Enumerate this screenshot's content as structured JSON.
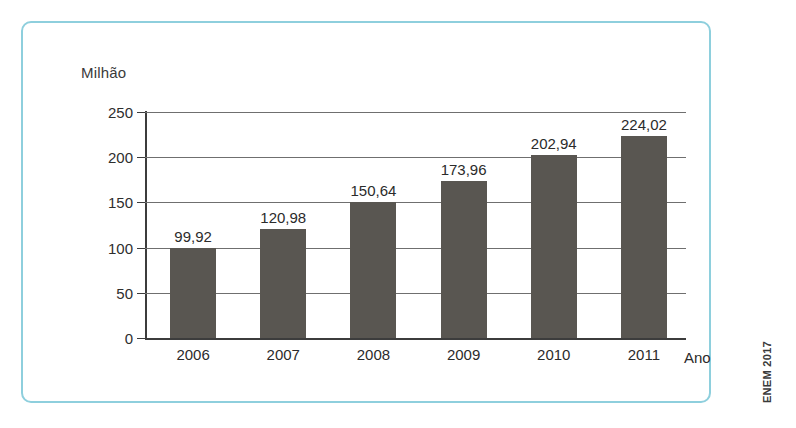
{
  "chart_data": {
    "type": "bar",
    "title": "",
    "subtitle": "",
    "categories": [
      "2006",
      "2007",
      "2008",
      "2009",
      "2010",
      "2011"
    ],
    "values": [
      99.92,
      120.98,
      150.64,
      173.96,
      202.94,
      224.02
    ],
    "value_labels": [
      "99,92",
      "120,98",
      "150,64",
      "173,96",
      "202,94",
      "224,02"
    ],
    "xlabel": "Ano",
    "ylabel": "Milhão",
    "ylim": [
      0,
      250
    ],
    "yticks": [
      250,
      200,
      150,
      100,
      50,
      0
    ],
    "ytick_labels": [
      "250",
      "200",
      "150",
      "100",
      "50",
      "0"
    ],
    "grid": true,
    "legend": null,
    "legend_position": "none",
    "bar_color": "#595651",
    "annotations": [
      "ENEM 2017"
    ]
  },
  "figure": {
    "border_color": "#8ecfdd",
    "background": "#ffffff"
  },
  "source": {
    "credit": "ENEM 2017"
  }
}
